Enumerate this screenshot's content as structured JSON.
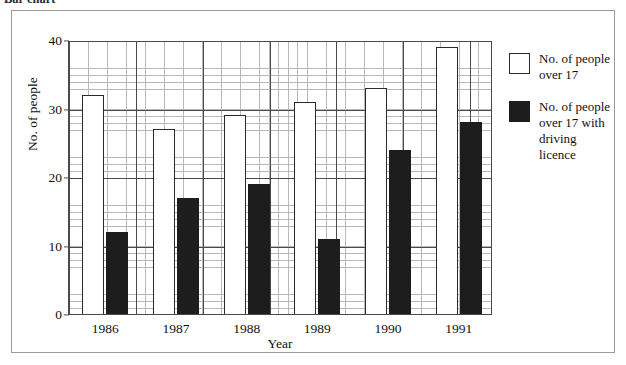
{
  "caption": {
    "text": "Bar chart"
  },
  "chart_data": {
    "type": "bar",
    "title": "",
    "subtitle": "",
    "xlabel": "Year",
    "ylabel": "No. of people",
    "categories": [
      "1986",
      "1987",
      "1988",
      "1989",
      "1990",
      "1991"
    ],
    "series": [
      {
        "name": "No. of people over 17",
        "color": "#ffffff",
        "swatch": "light",
        "values": [
          32,
          27,
          29,
          31,
          33,
          39
        ]
      },
      {
        "name": "No. of people over 17 with driving licence",
        "color": "#1d1d1d",
        "swatch": "dark",
        "values": [
          12,
          17,
          19,
          11,
          24,
          28
        ]
      }
    ],
    "ylim": [
      0,
      40
    ],
    "yticks": [
      0,
      10,
      20,
      30,
      40
    ],
    "ytick_labels": [
      "0",
      "10",
      "20",
      "30",
      "40"
    ],
    "grid": true,
    "grid_minor": true,
    "legend_position": "right"
  },
  "legend": {
    "entries": [
      {
        "label": "No. of people over 17",
        "swatch": "light"
      },
      {
        "label": "No. of people over 17 with driving licence",
        "swatch": "dark"
      }
    ]
  }
}
